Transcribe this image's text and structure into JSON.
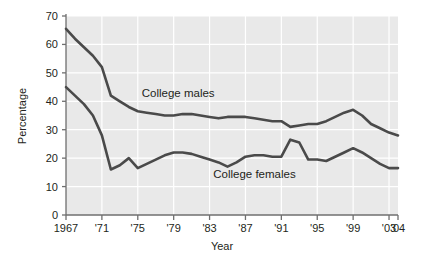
{
  "chart_data": {
    "type": "line",
    "title": "",
    "xlabel": "Year",
    "ylabel": "Percentage",
    "xlim": [
      1967,
      2004
    ],
    "ylim": [
      0,
      70
    ],
    "ytick_step": 10,
    "yticks": [
      0,
      10,
      20,
      30,
      40,
      50,
      60,
      70
    ],
    "ytick_labels": [
      "0",
      "10",
      "20",
      "30",
      "40",
      "50",
      "60",
      "70"
    ],
    "xticks": [
      1967,
      1971,
      1975,
      1979,
      1983,
      1987,
      1991,
      1995,
      1999,
      2003,
      2004
    ],
    "xtick_labels": [
      "1967",
      "'71",
      "'75",
      "'79",
      "'83",
      "'87",
      "'91",
      "'95",
      "'99",
      "'03",
      "'04"
    ],
    "grid": true,
    "grid_color": "#ffffff",
    "plot_background": "#e9e9e9",
    "line_color": "#4a4a4a",
    "legend_position": "inline-annotations",
    "x": [
      1967,
      1968,
      1969,
      1970,
      1971,
      1972,
      1973,
      1974,
      1975,
      1976,
      1977,
      1978,
      1979,
      1980,
      1981,
      1982,
      1983,
      1984,
      1985,
      1986,
      1987,
      1988,
      1989,
      1990,
      1991,
      1992,
      1993,
      1994,
      1995,
      1996,
      1997,
      1998,
      1999,
      2000,
      2001,
      2002,
      2003,
      2004
    ],
    "series": [
      {
        "name": "College males",
        "label": "College males",
        "values": [
          65.5,
          62.0,
          59.0,
          56.0,
          52.0,
          42.0,
          40.0,
          38.0,
          36.5,
          36.0,
          35.5,
          35.0,
          35.0,
          35.5,
          35.5,
          35.0,
          34.5,
          34.0,
          34.5,
          34.5,
          34.5,
          34.0,
          33.5,
          33.0,
          33.0,
          31.0,
          31.5,
          32.0,
          32.0,
          33.0,
          34.5,
          36.0,
          37.0,
          35.0,
          32.0,
          30.5,
          29.0,
          28.0
        ]
      },
      {
        "name": "College females",
        "label": "College females",
        "values": [
          45.0,
          42.0,
          39.0,
          35.0,
          28.0,
          16.0,
          17.5,
          20.0,
          16.5,
          18.0,
          19.5,
          21.0,
          22.0,
          22.0,
          21.5,
          20.5,
          19.5,
          18.5,
          17.0,
          18.5,
          20.5,
          21.0,
          21.0,
          20.5,
          20.5,
          26.5,
          25.5,
          19.5,
          19.5,
          19.0,
          20.5,
          22.0,
          23.5,
          22.0,
          20.0,
          18.0,
          16.5,
          16.5
        ]
      }
    ],
    "annotations": [
      {
        "text": "College males",
        "x": 1979.5,
        "y": 41.5
      },
      {
        "text": "College females",
        "x": 1988.0,
        "y": 13.0
      }
    ]
  },
  "layout": {
    "plot_left": 66,
    "plot_right": 398,
    "plot_top": 16,
    "plot_bottom": 215
  }
}
